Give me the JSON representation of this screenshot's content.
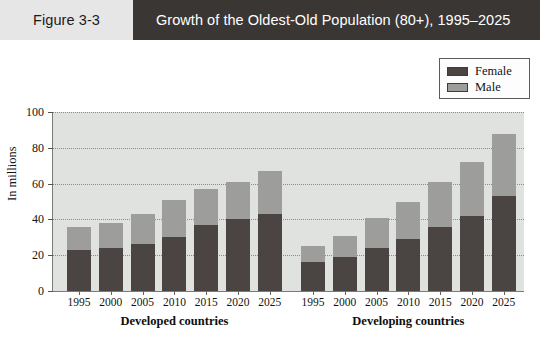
{
  "header": {
    "figure_number": "Figure 3-3",
    "title": "Growth of the Oldest-Old Population (80+), 1995–2025",
    "panel_color": "#e6e6e6",
    "title_bar_color": "#3a3634",
    "title_text_color": "#ffffff"
  },
  "legend": {
    "position": "top-right",
    "entries": [
      {
        "label": "Female",
        "color": "#4a4543"
      },
      {
        "label": "Male",
        "color": "#9d9e9c"
      }
    ]
  },
  "chart_data": {
    "type": "bar",
    "subtype": "stacked",
    "title": "Growth of the Oldest-Old Population (80+), 1995–2025",
    "xlabel": "",
    "ylabel": "In millions",
    "ylim": [
      0,
      100
    ],
    "yticks": [
      0,
      20,
      40,
      60,
      80,
      100
    ],
    "ytick_labels": [
      "0",
      "20",
      "40",
      "60",
      "80",
      "100"
    ],
    "grid": true,
    "legend_position": "top-right",
    "plot_background": "#e0e2e0",
    "categories": [
      "1995",
      "2000",
      "2005",
      "2010",
      "2015",
      "2020",
      "2025"
    ],
    "groups": [
      {
        "name": "Developed countries",
        "label": "Developed countries",
        "categories": [
          "1995",
          "2000",
          "2005",
          "2010",
          "2015",
          "2020",
          "2025"
        ],
        "series": [
          {
            "name": "Female",
            "color": "#4a4543",
            "values": [
              23,
              24,
              26,
              30,
              37,
              40,
              43
            ]
          },
          {
            "name": "Male",
            "color": "#9d9e9c",
            "values": [
              13,
              14,
              17,
              21,
              20,
              21,
              24
            ]
          }
        ],
        "totals": [
          36,
          38,
          43,
          51,
          57,
          61,
          67
        ]
      },
      {
        "name": "Developing countries",
        "label": "Developing countries",
        "categories": [
          "1995",
          "2000",
          "2005",
          "2010",
          "2015",
          "2020",
          "2025"
        ],
        "series": [
          {
            "name": "Female",
            "color": "#4a4543",
            "values": [
              16,
              19,
              24,
              29,
              36,
              42,
              53
            ]
          },
          {
            "name": "Male",
            "color": "#9d9e9c",
            "values": [
              9,
              12,
              17,
              21,
              25,
              30,
              35
            ]
          }
        ],
        "totals": [
          25,
          31,
          41,
          50,
          61,
          72,
          88
        ]
      }
    ]
  }
}
